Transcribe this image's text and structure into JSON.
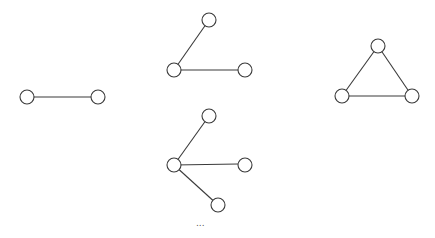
{
  "diagram": {
    "type": "graph-sequence",
    "node_radius": 7,
    "stroke_color": "#3a3a3a",
    "graphs": [
      {
        "name": "single-edge",
        "nodes": [
          {
            "id": "a",
            "x": 27,
            "y": 97
          },
          {
            "id": "b",
            "x": 98,
            "y": 97
          }
        ],
        "edges": [
          [
            "a",
            "b"
          ]
        ]
      },
      {
        "name": "path-two-edges",
        "nodes": [
          {
            "id": "c",
            "x": 174,
            "y": 70
          },
          {
            "id": "t",
            "x": 209,
            "y": 20
          },
          {
            "id": "r",
            "x": 245,
            "y": 70
          }
        ],
        "edges": [
          [
            "c",
            "t"
          ],
          [
            "c",
            "r"
          ]
        ]
      },
      {
        "name": "star-three-edges",
        "nodes": [
          {
            "id": "c",
            "x": 174,
            "y": 165
          },
          {
            "id": "t",
            "x": 209,
            "y": 116
          },
          {
            "id": "r",
            "x": 245,
            "y": 165
          },
          {
            "id": "b",
            "x": 218,
            "y": 205
          }
        ],
        "edges": [
          [
            "c",
            "t"
          ],
          [
            "c",
            "r"
          ],
          [
            "c",
            "b"
          ]
        ]
      },
      {
        "name": "triangle",
        "nodes": [
          {
            "id": "t",
            "x": 378,
            "y": 46
          },
          {
            "id": "l",
            "x": 342,
            "y": 96
          },
          {
            "id": "r",
            "x": 412,
            "y": 96
          }
        ],
        "edges": [
          [
            "t",
            "l"
          ],
          [
            "t",
            "r"
          ],
          [
            "l",
            "r"
          ]
        ]
      }
    ],
    "ellipsis": "..."
  }
}
